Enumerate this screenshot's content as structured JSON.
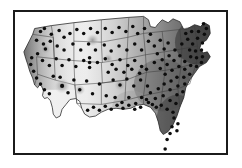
{
  "figure": {
    "type": "choropleth-dot-map",
    "title": "",
    "caption": "",
    "region": "Contiguous United States",
    "background_color": "#ffffff",
    "frame": {
      "visible": true,
      "color": "#1b1b1b",
      "width_px": 2,
      "x": 13,
      "y": 10,
      "width": 215,
      "height": 145
    },
    "map": {
      "outline_color": "#2a2a2a",
      "state_border_color": "#3a3a3a",
      "dot_color": "#0d0d0d",
      "dot_radius_px": 2.1,
      "halo_color": "#9a9a9a",
      "shading_description": "Grayscale gradient, lightest in the interior West, darkest along the East Coast and Northeast",
      "gradient_light": "#f0f0f0",
      "gradient_mid": "#b4b4b4",
      "gradient_dark": "#4a4a4a",
      "gradient_darkest": "#303030"
    },
    "legend": {
      "visible": false,
      "entries": []
    },
    "axes": {
      "visible": false,
      "x_ticks": [],
      "y_ticks": []
    }
  },
  "chart_data": {
    "type": "heatmap",
    "title": "",
    "subtitle": "",
    "xlabel": "",
    "ylabel": "",
    "projection": "albers-usa-approx",
    "grid": false,
    "legend_position": "none",
    "value_scale": {
      "label": "",
      "min": 0,
      "max": 100,
      "colormap": "grayscale (light = low, dark = high)"
    },
    "regions": [
      {
        "name": "Pacific Northwest Coast",
        "value": 72,
        "shade": "#707070"
      },
      {
        "name": "Washington",
        "value": 60,
        "shade": "#8a8a8a"
      },
      {
        "name": "Oregon",
        "value": 52,
        "shade": "#9c9c9c"
      },
      {
        "name": "California",
        "value": 38,
        "shade": "#c9c9c9"
      },
      {
        "name": "Nevada",
        "value": 16,
        "shade": "#eeeeee"
      },
      {
        "name": "Idaho",
        "value": 24,
        "shade": "#e2e2e2"
      },
      {
        "name": "Montana",
        "value": 32,
        "shade": "#d2d2d2"
      },
      {
        "name": "Wyoming",
        "value": 22,
        "shade": "#e6e6e6"
      },
      {
        "name": "Utah",
        "value": 18,
        "shade": "#ececec"
      },
      {
        "name": "Arizona",
        "value": 20,
        "shade": "#eaeaea"
      },
      {
        "name": "New Mexico",
        "value": 20,
        "shade": "#e9e9e9"
      },
      {
        "name": "Colorado",
        "value": 26,
        "shade": "#dedede"
      },
      {
        "name": "North Dakota",
        "value": 40,
        "shade": "#c4c4c4"
      },
      {
        "name": "South Dakota",
        "value": 38,
        "shade": "#c9c9c9"
      },
      {
        "name": "Nebraska",
        "value": 36,
        "shade": "#cdcdcd"
      },
      {
        "name": "Kansas",
        "value": 34,
        "shade": "#d0d0d0"
      },
      {
        "name": "Oklahoma",
        "value": 34,
        "shade": "#d0d0d0"
      },
      {
        "name": "Texas",
        "value": 36,
        "shade": "#cccccc"
      },
      {
        "name": "Minnesota",
        "value": 50,
        "shade": "#a8a8a8"
      },
      {
        "name": "Iowa",
        "value": 48,
        "shade": "#acacac"
      },
      {
        "name": "Missouri",
        "value": 52,
        "shade": "#a2a2a2"
      },
      {
        "name": "Arkansas",
        "value": 58,
        "shade": "#949494"
      },
      {
        "name": "Louisiana",
        "value": 62,
        "shade": "#8a8a8a"
      },
      {
        "name": "Wisconsin",
        "value": 60,
        "shade": "#8d8d8d"
      },
      {
        "name": "Illinois",
        "value": 64,
        "shade": "#848484"
      },
      {
        "name": "Michigan",
        "value": 66,
        "shade": "#7e7e7e"
      },
      {
        "name": "Indiana",
        "value": 70,
        "shade": "#767676"
      },
      {
        "name": "Ohio",
        "value": 74,
        "shade": "#6c6c6c"
      },
      {
        "name": "Kentucky",
        "value": 72,
        "shade": "#707070"
      },
      {
        "name": "Tennessee",
        "value": 74,
        "shade": "#6b6b6b"
      },
      {
        "name": "Mississippi",
        "value": 70,
        "shade": "#757575"
      },
      {
        "name": "Alabama",
        "value": 74,
        "shade": "#6a6a6a"
      },
      {
        "name": "Georgia",
        "value": 78,
        "shade": "#626262"
      },
      {
        "name": "Florida",
        "value": 86,
        "shade": "#4e4e4e"
      },
      {
        "name": "South Carolina",
        "value": 82,
        "shade": "#585858"
      },
      {
        "name": "North Carolina",
        "value": 80,
        "shade": "#5c5c5c"
      },
      {
        "name": "Virginia",
        "value": 84,
        "shade": "#545454"
      },
      {
        "name": "West Virginia",
        "value": 78,
        "shade": "#626262"
      },
      {
        "name": "Pennsylvania",
        "value": 86,
        "shade": "#4c4c4c"
      },
      {
        "name": "New York",
        "value": 88,
        "shade": "#474747"
      },
      {
        "name": "New England",
        "value": 92,
        "shade": "#3e3e3e"
      },
      {
        "name": "Maine",
        "value": 90,
        "shade": "#434343"
      },
      {
        "name": "Mid-Atlantic",
        "value": 94,
        "shade": "#3a3a3a"
      }
    ],
    "points": {
      "label": "Observation sites",
      "count": 186,
      "marker": "filled circle",
      "color": "#0d0d0d",
      "density_note": "Sparse in the interior West, dense across the Midwest, Southeast and Northeast"
    }
  }
}
